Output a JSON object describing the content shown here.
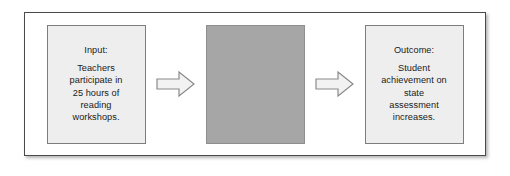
{
  "figure": {
    "type": "flow-diagram",
    "frame_border_color": "#4a4a4a",
    "background_color": "#ffffff"
  },
  "nodes": [
    {
      "id": "input",
      "name": "input-box",
      "fill_color": "#eeeeee",
      "border_color": "#7d7d7d",
      "heading": "Input:",
      "lines": [
        "Teachers",
        "participate in",
        "25 hours of",
        "reading",
        "workshops."
      ]
    },
    {
      "id": "middle",
      "name": "redacted-box",
      "fill_color": "#a6a6a6",
      "border_color": "#8f8f8f",
      "heading": "",
      "lines": []
    },
    {
      "id": "outcome",
      "name": "outcome-box",
      "fill_color": "#eeeeee",
      "border_color": "#7d7d7d",
      "heading": "Outcome:",
      "lines": [
        "Student",
        "achievement on",
        "state",
        "assessment",
        "increases."
      ]
    }
  ],
  "connectors": [
    {
      "id": "arrow-1",
      "name": "right-arrow-icon",
      "direction": "right",
      "fill_color": "#f2f2f2",
      "stroke_color": "#8a8a8a"
    },
    {
      "id": "arrow-2",
      "name": "right-arrow-icon",
      "direction": "right",
      "fill_color": "#f2f2f2",
      "stroke_color": "#8a8a8a"
    }
  ]
}
